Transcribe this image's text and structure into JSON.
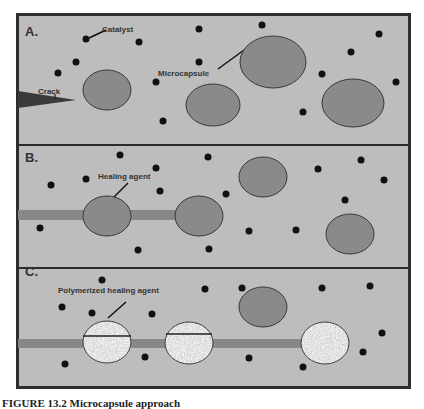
{
  "figure": {
    "caption": "FIGURE 13.2   Microcapsule approach",
    "colors": {
      "matrix": "#bdbdbd",
      "frame": "#2e2e2e",
      "capsule_fill": "#8a8a8a",
      "capsule_stroke": "#3a3a3a",
      "catalyst": "#111111",
      "crack_fill": "#3a3a3a",
      "crack_channel": "#888888",
      "polymerized_fill": "#c9c9c9"
    }
  },
  "panels": [
    {
      "label": "A.",
      "annotations": [
        {
          "text": "Catalyst",
          "points_to": "catalyst particle"
        },
        {
          "text": "Crack",
          "points_to": "crack tip"
        },
        {
          "text": "Microcapsule",
          "points_to": "microcapsule"
        }
      ]
    },
    {
      "label": "B.",
      "annotations": [
        {
          "text": "Healing agent",
          "points_to": "ruptured microcapsule"
        }
      ]
    },
    {
      "label": "C.",
      "annotations": [
        {
          "text": "Polymerized healing agent",
          "points_to": "filled capsule"
        }
      ]
    }
  ]
}
